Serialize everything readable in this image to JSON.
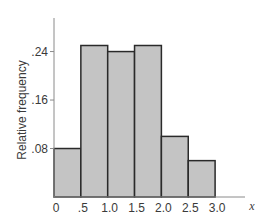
{
  "chart_data": {
    "type": "bar",
    "subtype": "histogram",
    "title": "",
    "xlabel": "x",
    "ylabel": "Relative frequency",
    "bins": [
      {
        "from": 0.0,
        "to": 0.5,
        "value": 0.08
      },
      {
        "from": 0.5,
        "to": 1.0,
        "value": 0.25
      },
      {
        "from": 1.0,
        "to": 1.5,
        "value": 0.24
      },
      {
        "from": 1.5,
        "to": 2.0,
        "value": 0.25
      },
      {
        "from": 2.0,
        "to": 2.5,
        "value": 0.1
      },
      {
        "from": 2.5,
        "to": 3.0,
        "value": 0.06
      }
    ],
    "categories": [
      "0-.5",
      ".5-1.0",
      "1.0-1.5",
      "1.5-2.0",
      "2.0-2.5",
      "2.5-3.0"
    ],
    "values": [
      0.08,
      0.25,
      0.24,
      0.25,
      0.1,
      0.06
    ],
    "xticks": [
      "0",
      ".5",
      "1.0",
      "1.5",
      "2.0",
      "2.5",
      "3.0"
    ],
    "xtick_values": [
      0,
      0.5,
      1.0,
      1.5,
      2.0,
      2.5,
      3.0
    ],
    "yticks": [
      ".08",
      ".16",
      ".24"
    ],
    "ytick_values": [
      0.08,
      0.16,
      0.24
    ],
    "xlim": [
      0,
      3.6
    ],
    "ylim": [
      0,
      0.29
    ],
    "grid": false,
    "legend": null,
    "colors": {
      "bar_fill": "#c4c4c4",
      "bar_edge": "#2a2a2a",
      "axis": "#8a8a8a",
      "text": "#3a3a3a"
    }
  }
}
